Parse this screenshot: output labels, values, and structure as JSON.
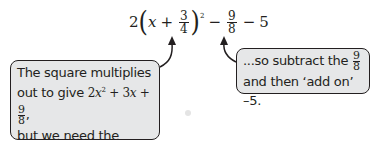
{
  "equation": {
    "coefficient": "2",
    "open_paren": "(",
    "variable": "x",
    "plus": "+",
    "inner_fraction": {
      "numerator": "3",
      "denominator": "4"
    },
    "close_paren": ")",
    "exponent": "2",
    "minus1": "−",
    "subtract_fraction": {
      "numerator": "9",
      "denominator": "8"
    },
    "minus2": "−",
    "constant": "5"
  },
  "callout_left": {
    "line1": "The square multiplies",
    "line2_prefix": "out to give ",
    "term1_coef": "2",
    "term1_var": "x",
    "term1_exp": "2",
    "plus_a": " + 3",
    "term2_var": "x",
    "plus_b": " + ",
    "fraction": {
      "numerator": "9",
      "denominator": "8"
    },
    "line2_suffix": ",",
    "line3": "but we need the",
    "line4": "constant term to be –5..."
  },
  "callout_right": {
    "line1_prefix": "...so subtract the ",
    "fraction": {
      "numerator": "9",
      "denominator": "8"
    },
    "line2": "and then ‘add on’ –5."
  },
  "colors": {
    "callout_fill": "#e6e7e8",
    "ink": "#231f20"
  }
}
